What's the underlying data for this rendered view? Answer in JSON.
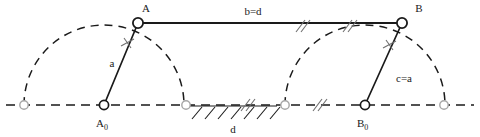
{
  "diagram": {
    "type": "kinematic-linkage",
    "canvas": {
      "width": 480,
      "height": 137
    },
    "colors": {
      "line": "#1a1a1a",
      "dashed": "#1a1a1a",
      "ghost_joint_stroke": "#9a9a9a",
      "tick": "#7a7a7a",
      "background": "#ffffff"
    },
    "labels": {
      "point_a": "A",
      "point_a0_main": "A",
      "point_a0_sub": "0",
      "point_b": "B",
      "point_b0_main": "B",
      "point_b0_sub": "0",
      "link_a": "a",
      "link_bd": "b=d",
      "link_ca": "c=a",
      "link_d": "d"
    },
    "joints": [
      {
        "name": "A",
        "x": 138,
        "y": 23,
        "kind": "moving-pin"
      },
      {
        "name": "B",
        "x": 402,
        "y": 23,
        "kind": "moving-pin"
      },
      {
        "name": "A0",
        "x": 104,
        "y": 105,
        "kind": "fixed-pin"
      },
      {
        "name": "B0",
        "x": 365,
        "y": 105,
        "kind": "fixed-pin"
      }
    ],
    "ghost_joints": [
      {
        "x": 24,
        "y": 105
      },
      {
        "x": 186,
        "y": 105
      },
      {
        "x": 285,
        "y": 105
      },
      {
        "x": 444,
        "y": 105
      }
    ],
    "links": [
      {
        "name": "crank-a",
        "from": "A0",
        "to": "A",
        "label": "a",
        "style": "solid"
      },
      {
        "name": "coupler-b",
        "from": "A",
        "to": "B",
        "label": "b=d",
        "style": "solid"
      },
      {
        "name": "rocker-c",
        "from": "B0",
        "to": "B",
        "label": "c=a",
        "style": "solid"
      },
      {
        "name": "ground-d",
        "from": "A0",
        "to": "B0",
        "label": "d",
        "style": "dashed"
      }
    ],
    "arcs": [
      {
        "name": "arc-a",
        "center_x": 104,
        "center_y": 105,
        "radius": 80,
        "style": "dashed"
      },
      {
        "name": "arc-b",
        "center_x": 365,
        "center_y": 105,
        "radius": 80,
        "style": "dashed"
      }
    ],
    "tick_marks": [
      {
        "name": "cross-tick-on-a",
        "x": 128,
        "y": 43,
        "kind": "cross"
      },
      {
        "name": "cross-tick-on-c",
        "x": 390,
        "y": 45,
        "kind": "cross"
      },
      {
        "name": "double-slash-on-b",
        "x": 348,
        "y": 26,
        "kind": "double-slash"
      },
      {
        "name": "double-slash-on-d",
        "x": 318,
        "y": 105,
        "kind": "double-slash"
      },
      {
        "name": "double-slash-on-b2",
        "x": 302,
        "y": 26,
        "kind": "double-slash"
      },
      {
        "name": "double-slash-on-d2",
        "x": 246,
        "y": 105,
        "kind": "double-slash"
      }
    ],
    "ground_hatching": {
      "name": "ground-hatch",
      "x_start": 190,
      "x_end": 277,
      "y": 106,
      "stroke_count": 7
    },
    "baseline": {
      "y": 105,
      "x_start": 6,
      "x_end": 474,
      "style": "dashed"
    }
  }
}
